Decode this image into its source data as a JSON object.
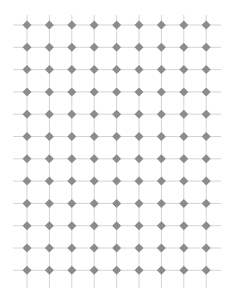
{
  "grid": {
    "columns": 9,
    "rows": 12,
    "x_start": 27,
    "y_start": 25,
    "x_step": 22.4,
    "y_step": 22.3,
    "h_line_extent": [
      13,
      221
    ],
    "v_line_extent": [
      15,
      288
    ],
    "line_color": "#d4d4d4",
    "node_color": "#8c8c8c",
    "node_half_size": 4.5
  }
}
